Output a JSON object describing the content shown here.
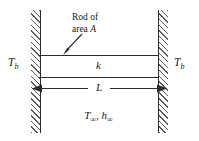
{
  "figure": {
    "type": "engineering-diagram"
  },
  "labels": {
    "rod_annotation_line1": "Rod of",
    "rod_annotation_line2_prefix": "area ",
    "rod_annotation_line2_symbol": "A",
    "conductivity": "k",
    "length_dimension": "L",
    "base_temp_left_symbol": "T",
    "base_temp_left_subscript": "b",
    "base_temp_right_symbol": "T",
    "base_temp_right_subscript": "b",
    "ambient_temp_symbol": "T",
    "ambient_temp_subscript": "∞",
    "ambient_separator": ", ",
    "ambient_coeff_symbol": "h",
    "ambient_coeff_subscript": "∞"
  },
  "colors": {
    "line": "#2b2b2b",
    "hatch": "#5a5a5a",
    "background": "#ffffff",
    "text": "#1a1a1a"
  },
  "icons": {
    "pointer_arrow": "arrow-down-left",
    "dimension_arrow": "double-headed-horizontal-arrow"
  }
}
